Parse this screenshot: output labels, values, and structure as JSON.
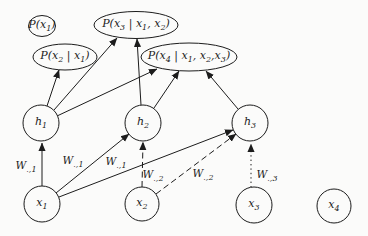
{
  "diagram": {
    "kind": "graphical-model-figure",
    "colors": {
      "stroke": "#1c1c1c",
      "background": "#fbfbfa",
      "text": "#1b1b1b"
    },
    "nodes": {
      "outputs": [
        {
          "shape": "ellipse",
          "parts": [
            "P(x",
            "1",
            ")"
          ]
        },
        {
          "shape": "ellipse",
          "parts": [
            "P(x",
            "2",
            " | x",
            "1",
            ")"
          ]
        },
        {
          "shape": "ellipse",
          "parts": [
            "P(x",
            "3",
            " | x",
            "1",
            ", x",
            "2",
            ")"
          ]
        },
        {
          "shape": "ellipse",
          "parts": [
            "P(x",
            "4",
            " | x",
            "1",
            ", x",
            "2",
            ",x",
            "3",
            ")"
          ]
        }
      ],
      "hidden": [
        {
          "shape": "circle",
          "parts": [
            "h",
            "1"
          ]
        },
        {
          "shape": "circle",
          "parts": [
            "h",
            "2"
          ]
        },
        {
          "shape": "circle",
          "parts": [
            "h",
            "3"
          ]
        }
      ],
      "inputs": [
        {
          "shape": "circle",
          "parts": [
            "x",
            "1"
          ]
        },
        {
          "shape": "circle",
          "parts": [
            "x",
            "2"
          ]
        },
        {
          "shape": "circle",
          "parts": [
            "x",
            "3"
          ]
        },
        {
          "shape": "circle",
          "parts": [
            "x",
            "4"
          ]
        }
      ]
    },
    "edge_labels": [
      {
        "parts": [
          "W",
          ".,1"
        ]
      },
      {
        "parts": [
          "W",
          ".,1"
        ]
      },
      {
        "parts": [
          "W",
          ".,1"
        ]
      },
      {
        "parts": [
          "W",
          ".,2"
        ]
      },
      {
        "parts": [
          "W",
          ".,2"
        ]
      },
      {
        "parts": [
          "W",
          ".,3"
        ]
      }
    ],
    "edges": [
      {
        "from": "x1",
        "to": "h1",
        "style": "solid",
        "label": "W.,1"
      },
      {
        "from": "x1",
        "to": "h2",
        "style": "solid",
        "label": "W.,1"
      },
      {
        "from": "x1",
        "to": "h3",
        "style": "solid",
        "label": "W.,1"
      },
      {
        "from": "x2",
        "to": "h2",
        "style": "dashed",
        "label": "W.,2"
      },
      {
        "from": "x2",
        "to": "h3",
        "style": "dashed",
        "label": "W.,2"
      },
      {
        "from": "x3",
        "to": "h3",
        "style": "dotted",
        "label": "W.,3"
      },
      {
        "from": "h1",
        "to": "P(x2|x1)",
        "style": "solid"
      },
      {
        "from": "h1",
        "to": "P(x3|x1,x2)",
        "style": "solid"
      },
      {
        "from": "h1",
        "to": "P(x4|x1,x2,x3)",
        "style": "solid"
      },
      {
        "from": "h2",
        "to": "P(x3|x1,x2)",
        "style": "solid"
      },
      {
        "from": "h2",
        "to": "P(x4|x1,x2,x3)",
        "style": "solid"
      },
      {
        "from": "h3",
        "to": "P(x4|x1,x2,x3)",
        "style": "solid"
      }
    ]
  }
}
